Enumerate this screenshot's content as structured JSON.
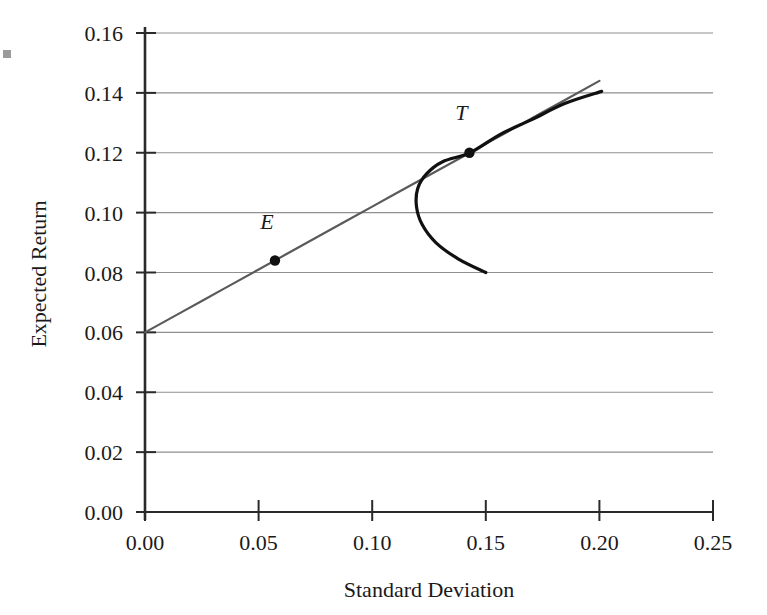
{
  "chart_data": {
    "type": "line",
    "title": "",
    "xlabel": "Standard Deviation",
    "ylabel": "Expected Return",
    "xlim": [
      0.0,
      0.25
    ],
    "ylim": [
      0.0,
      0.16
    ],
    "xticks": [
      "0.00",
      "0.05",
      "0.10",
      "0.15",
      "0.20",
      "0.25"
    ],
    "xtick_values": [
      0.0,
      0.05,
      0.1,
      0.15,
      0.2,
      0.25
    ],
    "yticks": [
      "0.00",
      "0.02",
      "0.04",
      "0.06",
      "0.08",
      "0.10",
      "0.12",
      "0.14",
      "0.16"
    ],
    "ytick_values": [
      0.0,
      0.02,
      0.04,
      0.06,
      0.08,
      0.1,
      0.12,
      0.14,
      0.16
    ],
    "grid": "horizontal",
    "legend": "none",
    "series": [
      {
        "name": "capital-allocation-line",
        "type": "line",
        "color": "#5a5a5a",
        "width": 2.2,
        "description": "Straight tangent line from the risk-free intercept through the tangency portfolio T",
        "x": [
          0.0,
          0.025,
          0.05,
          0.075,
          0.1,
          0.125,
          0.143,
          0.15,
          0.175,
          0.2
        ],
        "y": [
          0.06,
          0.0705,
          0.081,
          0.0915,
          0.102,
          0.1125,
          0.12,
          0.123,
          0.1335,
          0.144
        ]
      },
      {
        "name": "efficient-frontier",
        "type": "line",
        "color": "#111111",
        "width": 3.2,
        "description": "Minimum-variance hyperbola of risky assets, upper and lower branch",
        "x": [
          0.15,
          0.138,
          0.128,
          0.122,
          0.1195,
          0.12,
          0.124,
          0.131,
          0.143,
          0.156,
          0.17,
          0.185,
          0.201
        ],
        "y": [
          0.08,
          0.0845,
          0.09,
          0.096,
          0.102,
          0.108,
          0.113,
          0.117,
          0.12,
          0.126,
          0.131,
          0.1365,
          0.1405
        ]
      }
    ],
    "points": [
      {
        "name": "E",
        "label": "E",
        "x": 0.0572,
        "y": 0.084,
        "label_offset_x": -0.0035,
        "label_offset_y": 0.0105,
        "color": "#111111"
      },
      {
        "name": "T",
        "label": "T",
        "x": 0.1428,
        "y": 0.12,
        "label_offset_x": -0.0035,
        "label_offset_y": 0.011,
        "color": "#111111"
      }
    ],
    "axis_color": "#2a2a2a",
    "grid_color": "#8f8f8f"
  },
  "figure": {
    "scan_artifact": "edge-scan-mark"
  }
}
